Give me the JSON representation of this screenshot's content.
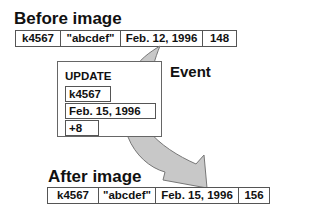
{
  "before": {
    "heading": "Before image",
    "cells": [
      "k4567",
      "\"abcdef\"",
      "Feb. 12, 1996",
      "148"
    ]
  },
  "event": {
    "label": "Event",
    "box_title": "UPDATE",
    "fields": [
      "k4567",
      "Feb. 15, 1996",
      "+8"
    ]
  },
  "after": {
    "heading": "After image",
    "cells": [
      "k4567",
      "\"abcdef\"",
      "Feb. 15, 1996",
      "156"
    ]
  },
  "colors": {
    "arrow_fill": "#c8c8c8",
    "arrow_stroke": "#777777",
    "border": "#555555"
  }
}
